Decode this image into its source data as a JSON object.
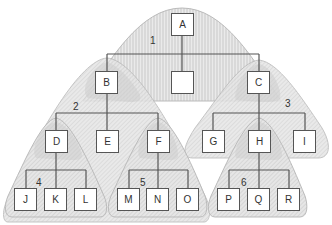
{
  "diagram": {
    "type": "tree",
    "nodes": [
      {
        "id": "A",
        "label": "A",
        "x": 171,
        "y": 13
      },
      {
        "id": "X",
        "label": "",
        "x": 171,
        "y": 71
      },
      {
        "id": "B",
        "label": "B",
        "x": 95,
        "y": 71
      },
      {
        "id": "C",
        "label": "C",
        "x": 247,
        "y": 71
      },
      {
        "id": "D",
        "label": "D",
        "x": 45,
        "y": 130
      },
      {
        "id": "E",
        "label": "E",
        "x": 96,
        "y": 130
      },
      {
        "id": "F",
        "label": "F",
        "x": 147,
        "y": 130
      },
      {
        "id": "G",
        "label": "G",
        "x": 202,
        "y": 130
      },
      {
        "id": "H",
        "label": "H",
        "x": 248,
        "y": 130
      },
      {
        "id": "I",
        "label": "I",
        "x": 293,
        "y": 130
      },
      {
        "id": "J",
        "label": "J",
        "x": 14,
        "y": 188
      },
      {
        "id": "K",
        "label": "K",
        "x": 44,
        "y": 188
      },
      {
        "id": "L",
        "label": "L",
        "x": 74,
        "y": 188
      },
      {
        "id": "M",
        "label": "M",
        "x": 117,
        "y": 188
      },
      {
        "id": "N",
        "label": "N",
        "x": 146,
        "y": 188
      },
      {
        "id": "O",
        "label": "O",
        "x": 176,
        "y": 188
      },
      {
        "id": "P",
        "label": "P",
        "x": 217,
        "y": 188
      },
      {
        "id": "Q",
        "label": "Q",
        "x": 247,
        "y": 188
      },
      {
        "id": "R",
        "label": "R",
        "x": 277,
        "y": 188
      }
    ],
    "regions": [
      {
        "label": "1",
        "x": 150,
        "y": 35
      },
      {
        "label": "2",
        "x": 73,
        "y": 101
      },
      {
        "label": "3",
        "x": 285,
        "y": 98
      },
      {
        "label": "4",
        "x": 36,
        "y": 177
      },
      {
        "label": "5",
        "x": 140,
        "y": 177
      },
      {
        "label": "6",
        "x": 241,
        "y": 177
      }
    ]
  }
}
